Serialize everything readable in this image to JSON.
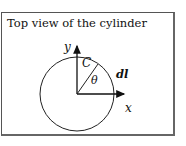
{
  "title": "Top view of the cylinder",
  "labels": {
    "y_axis": "y",
    "x_axis": "x",
    "curve": "C",
    "angle": "θ",
    "element": "dl"
  }
}
